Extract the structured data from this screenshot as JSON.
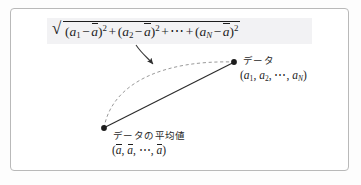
{
  "figure": {
    "title_formula_plain": "sqrt((a_1 - abar)^2 + (a_2 - abar)^2 + ... + (a_N - abar)^2)",
    "formula": {
      "radical_symbol": "√",
      "term1_open": "(",
      "term1_var": "a",
      "term1_sub": "1",
      "minus": "−",
      "mean_var": "a",
      "close_paren": ")",
      "square": "2",
      "plus": "+",
      "term2_sub": "2",
      "ellipsis": "⋯",
      "termN_sub": "N"
    },
    "labels": {
      "data_point_title": "データ",
      "data_point_coords": "(a₁, a₂, ⋯, a_N)",
      "mean_point_title": "データの平均値",
      "mean_point_coords": "(ā, ā, ⋯, ā)"
    },
    "colors": {
      "frame_border": "#b9b9b9",
      "ink": "#232323",
      "dashed_arc": "#8d8d8d",
      "solid_line": "#2a2a2a",
      "formula_highlight": "#f2f2f4",
      "page_background": "#fdfdfd"
    },
    "geometry": {
      "mean_point": [
        104,
        128
      ],
      "data_point": [
        234,
        62
      ],
      "pointer_arrow_tip": [
        155,
        70
      ]
    }
  }
}
